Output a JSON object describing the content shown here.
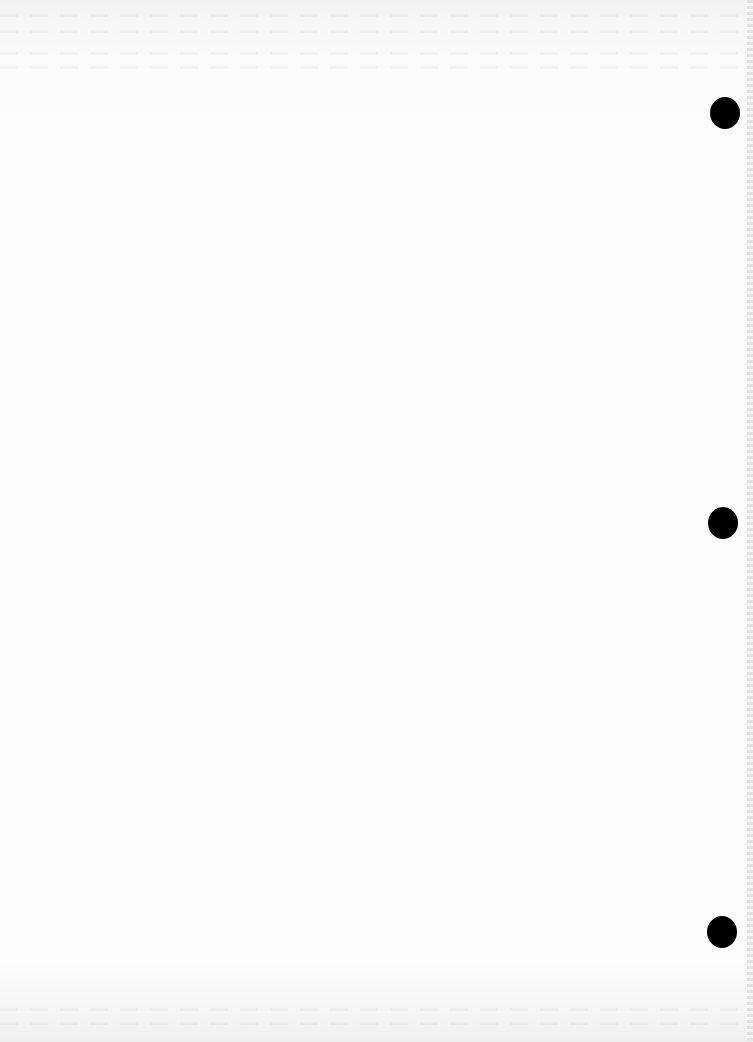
{
  "page": {
    "type": "blank scanned page",
    "background_color": "#fdfdfd",
    "punch_holes": [
      {
        "name": "top",
        "x": 710,
        "y": 97
      },
      {
        "name": "middle",
        "x": 708,
        "y": 507
      },
      {
        "name": "bottom",
        "x": 707,
        "y": 916
      }
    ],
    "hole_color": "#000000"
  }
}
